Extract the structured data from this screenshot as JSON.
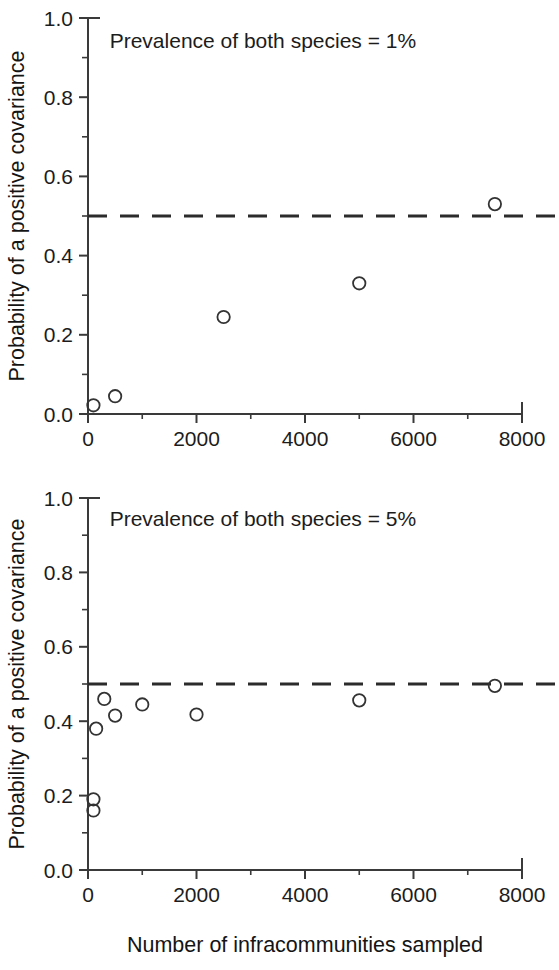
{
  "figure": {
    "width": 559,
    "height": 970,
    "background": "#ffffff",
    "ink_color": "#333333"
  },
  "axis_titles": {
    "y": "Probability of a positive covariance",
    "x": "Number of infracommunities sampled"
  },
  "y_tick_labels": [
    "0.0",
    "0.2",
    "0.4",
    "0.6",
    "0.8",
    "1.0"
  ],
  "x_tick_labels": [
    "0",
    "2000",
    "4000",
    "6000",
    "8000"
  ],
  "annotations": {
    "top": "Prevalence of both species = 1%",
    "bottom": "Prevalence of both species = 5%"
  },
  "chart_data": [
    {
      "type": "scatter",
      "title": "Prevalence of both species = 1%",
      "xlabel": "Number of infracommunities sampled",
      "ylabel": "Probability of a positive covariance",
      "xlim": [
        0,
        8000
      ],
      "ylim": [
        0.0,
        1.0
      ],
      "xticks": [
        0,
        2000,
        4000,
        6000,
        8000
      ],
      "yticks": [
        0.0,
        0.2,
        0.4,
        0.6,
        0.8,
        1.0
      ],
      "x_minor_ticks": [
        1000,
        3000,
        5000,
        7000
      ],
      "y_minor_ticks": [
        0.1,
        0.3,
        0.5,
        0.7,
        0.9
      ],
      "grid": false,
      "legend": "none",
      "marker": "open-circle",
      "reference_line": {
        "orientation": "horizontal",
        "y": 0.5,
        "style": "dashed"
      },
      "x": [
        100,
        500,
        2500,
        5000,
        7500
      ],
      "y": [
        0.022,
        0.045,
        0.245,
        0.33,
        0.53
      ]
    },
    {
      "type": "scatter",
      "title": "Prevalence of both species = 5%",
      "xlabel": "Number of infracommunities sampled",
      "ylabel": "Probability of a positive covariance",
      "xlim": [
        0,
        8000
      ],
      "ylim": [
        0.0,
        1.0
      ],
      "xticks": [
        0,
        2000,
        4000,
        6000,
        8000
      ],
      "yticks": [
        0.0,
        0.2,
        0.4,
        0.6,
        0.8,
        1.0
      ],
      "x_minor_ticks": [
        1000,
        3000,
        5000,
        7000
      ],
      "y_minor_ticks": [
        0.1,
        0.3,
        0.5,
        0.7,
        0.9
      ],
      "grid": false,
      "legend": "none",
      "marker": "open-circle",
      "reference_line": {
        "orientation": "horizontal",
        "y": 0.5,
        "style": "dashed"
      },
      "x": [
        100,
        100,
        150,
        300,
        500,
        1000,
        2000,
        5000,
        7500
      ],
      "y": [
        0.19,
        0.16,
        0.38,
        0.46,
        0.415,
        0.445,
        0.418,
        0.456,
        0.495
      ]
    }
  ]
}
